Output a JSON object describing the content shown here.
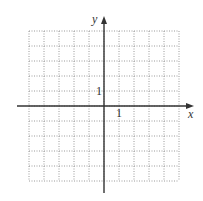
{
  "diagram": {
    "type": "coordinate-grid",
    "grid": {
      "x_min": -5,
      "x_max": 5,
      "y_min": -5,
      "y_max": 5,
      "cell_size_px": 15,
      "line_style": "dotted",
      "line_color": "#9a9a9a"
    },
    "axes": {
      "x_label": "x",
      "y_label": "y",
      "axis_color": "#333333"
    },
    "tick_labels": {
      "x_unit": "1",
      "y_unit": "1"
    }
  }
}
